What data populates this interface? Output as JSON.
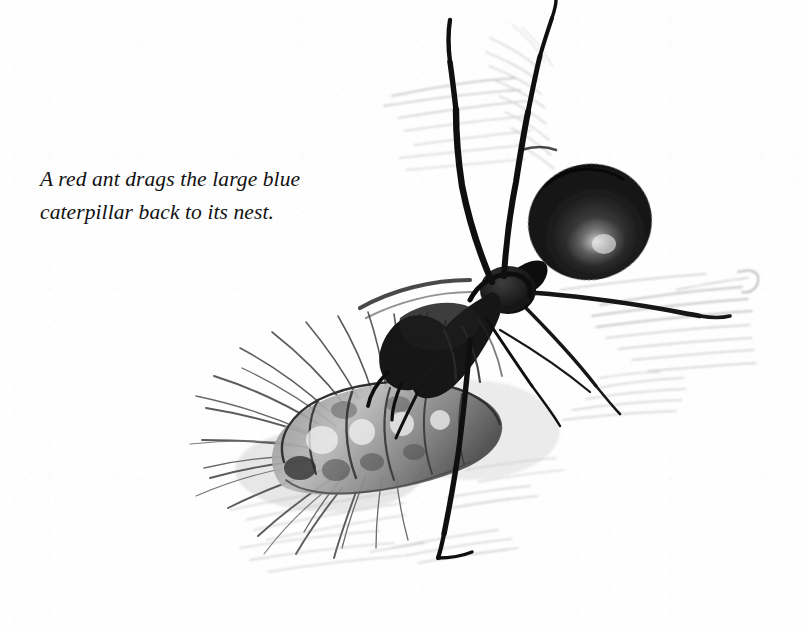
{
  "page": {
    "type": "scanned-book-illustration",
    "background_color": "#fefefe",
    "ink_color": "#111111",
    "width": 807,
    "height": 630
  },
  "caption": {
    "text": "A red ant drags the large blue\ncaterpillar back to its nest.",
    "line_1": "A red ant drags the large blue",
    "line_2": "caterpillar back to its nest.",
    "style": "italic-serif",
    "color": "#111111"
  },
  "illustration": {
    "title": "red ant dragging a large blue caterpillar",
    "medium": "pencil drawing",
    "subjects": [
      {
        "name": "red-ant",
        "parts": [
          "gaster",
          "petiole",
          "thorax",
          "head",
          "mandibles",
          "antenna-left",
          "antenna-right",
          "foreleg",
          "midleg",
          "hindleg"
        ]
      },
      {
        "name": "large-blue-caterpillar",
        "parts": [
          "body-segments",
          "bristles",
          "head"
        ]
      },
      {
        "name": "ground",
        "parts": [
          "grass-strokes",
          "soil-hatching"
        ]
      }
    ]
  }
}
